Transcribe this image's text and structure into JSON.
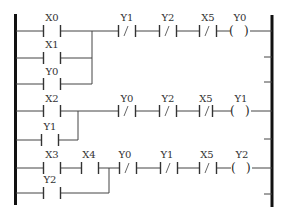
{
  "diagram": {
    "type": "ladder-logic",
    "rungs": [
      {
        "id": "rung-1",
        "parallel_inputs": [
          {
            "label": "X0",
            "type": "NO"
          },
          {
            "label": "X1",
            "type": "NO"
          },
          {
            "label": "Y0",
            "type": "NO"
          }
        ],
        "series_contacts": [
          {
            "label": "Y1",
            "type": "NC"
          },
          {
            "label": "Y2",
            "type": "NC"
          },
          {
            "label": "X5",
            "type": "NC"
          }
        ],
        "coil": {
          "label": "Y0"
        }
      },
      {
        "id": "rung-2",
        "parallel_inputs": [
          {
            "label": "X2",
            "type": "NO"
          },
          {
            "label": "Y1",
            "type": "NO"
          }
        ],
        "series_contacts": [
          {
            "label": "Y0",
            "type": "NC"
          },
          {
            "label": "Y2",
            "type": "NC"
          },
          {
            "label": "X5",
            "type": "NC"
          }
        ],
        "coil": {
          "label": "Y1"
        }
      },
      {
        "id": "rung-3",
        "parallel_inputs": [
          {
            "label": "X3",
            "type": "NO",
            "series_with": {
              "label": "X4",
              "type": "NO"
            }
          },
          {
            "label": "Y2",
            "type": "NO"
          }
        ],
        "series_contacts": [
          {
            "label": "Y0",
            "type": "NC"
          },
          {
            "label": "Y1",
            "type": "NC"
          },
          {
            "label": "X5",
            "type": "NC"
          }
        ],
        "coil": {
          "label": "Y2"
        }
      }
    ],
    "coil_symbol": "( )",
    "nc_symbol": "/"
  }
}
